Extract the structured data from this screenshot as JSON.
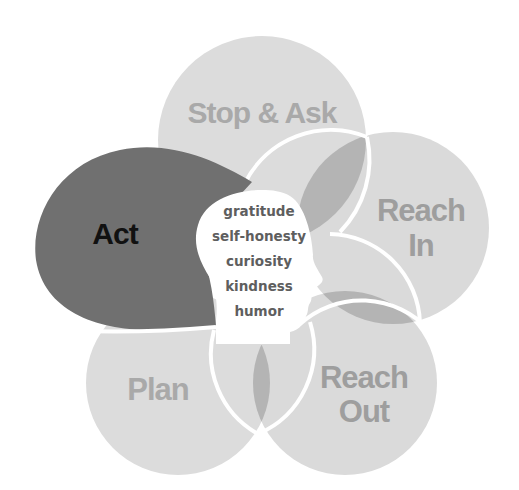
{
  "diagram": {
    "petals": [
      {
        "id": "stop-ask",
        "label_lines": [
          "Stop & Ask"
        ],
        "fill": "#dcdcdc",
        "text_color": "#a9a9a9"
      },
      {
        "id": "reach-in",
        "label_lines": [
          "Reach",
          "In"
        ],
        "fill": "#dadada",
        "text_color": "#9e9e9e"
      },
      {
        "id": "reach-out",
        "label_lines": [
          "Reach",
          "Out"
        ],
        "fill": "#dadada",
        "text_color": "#9e9e9e"
      },
      {
        "id": "plan",
        "label_lines": [
          "Plan"
        ],
        "fill": "#dcdcdc",
        "text_color": "#a9a9a9"
      },
      {
        "id": "act",
        "label_lines": [
          "Act"
        ],
        "fill": "#707070",
        "text_color": "#111111"
      }
    ],
    "overlap_fill": "#b4b4b4",
    "head": {
      "fill": "#ffffff",
      "virtues": [
        "gratitude",
        "self-honesty",
        "curiosity",
        "kindness",
        "humor"
      ]
    }
  }
}
